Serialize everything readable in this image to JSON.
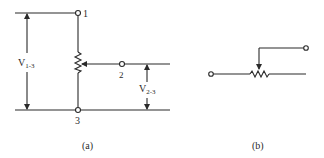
{
  "figure": {
    "panel_a": {
      "caption": "(a)",
      "terminals": {
        "t1": "1",
        "t2": "2",
        "t3": "3"
      },
      "voltage_labels": {
        "v13": {
          "main": "V",
          "sub": "1-3"
        },
        "v23": {
          "main": "V",
          "sub": "2-3"
        }
      }
    },
    "panel_b": {
      "caption": "(b)"
    }
  },
  "colors": {
    "line": "#2a2a2a",
    "background": "#ffffff"
  }
}
